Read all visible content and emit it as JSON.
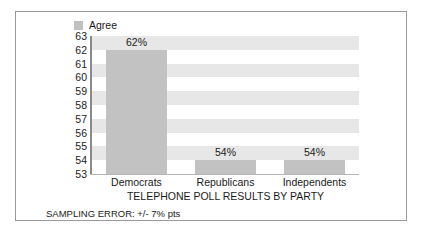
{
  "legend": {
    "entries": [
      {
        "label": "Agree",
        "color": "#c0c0c0"
      }
    ],
    "position": "top-left"
  },
  "colors": {
    "bar_fill": "#c2c2c2",
    "band_fill": "#e7e7e7",
    "plot_background": "#ffffff",
    "axis_line": "#8a8a8a",
    "frame_border": "#9a9a9a",
    "text": "#1a1a1a"
  },
  "chart_data": {
    "type": "bar",
    "title": "TELEPHONE POLL RESULTS BY PARTY",
    "subtitle": "",
    "xlabel": "",
    "ylabel": "",
    "categories": [
      "Democrats",
      "Republicans",
      "Independents"
    ],
    "series": [
      {
        "name": "Agree",
        "values": [
          62,
          54,
          54
        ],
        "data_labels": [
          "62%",
          "54%",
          "54%"
        ]
      }
    ],
    "ylim": [
      53,
      63
    ],
    "ytick_step": 1,
    "yticks": [
      63,
      62,
      61,
      60,
      59,
      58,
      57,
      56,
      55,
      54,
      53
    ],
    "ytick_labels": [
      "63",
      "62",
      "61",
      "60",
      "59",
      "58",
      "57",
      "56",
      "55",
      "54",
      "53"
    ],
    "grid": false,
    "alternating_row_bands": true,
    "legend": [
      "Agree"
    ],
    "legend_position": "top-left",
    "annotations": [
      "SAMPLING ERROR: +/- 7% pts"
    ]
  },
  "footnote": "SAMPLING ERROR: +/- 7% pts"
}
